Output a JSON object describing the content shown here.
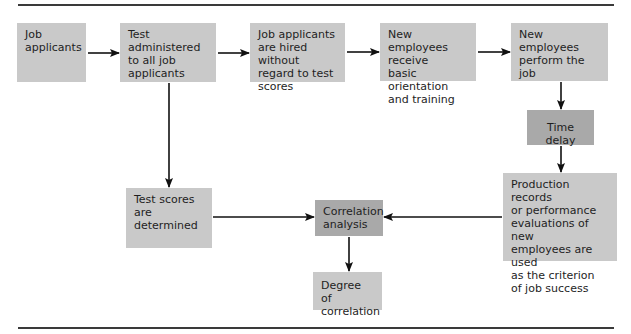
{
  "diagram": {
    "title": "",
    "nodes": [
      {
        "id": "job-applicants",
        "label": "Job\napplicants"
      },
      {
        "id": "test-administered",
        "label": "Test administered\nto all job\napplicants"
      },
      {
        "id": "hired-without-regard",
        "label": "Job applicants\nare hired without\nregard to test\nscores"
      },
      {
        "id": "orientation",
        "label": "New employees\nreceive\nbasic orientation\nand training"
      },
      {
        "id": "perform-job",
        "label": "New employees\nperform the\njob"
      },
      {
        "id": "time-delay",
        "label": "Time delay"
      },
      {
        "id": "production-records",
        "label": "Production records\nor performance\nevaluations of new\nemployees are used\nas the criterion\nof job success"
      },
      {
        "id": "test-scores",
        "label": "Test scores are\ndetermined"
      },
      {
        "id": "correlation-analysis",
        "label": "Correlation\nanalysis"
      },
      {
        "id": "degree-of-correlation",
        "label": "Degree of\ncorrelation"
      }
    ],
    "edges": [
      {
        "from": "job-applicants",
        "to": "test-administered"
      },
      {
        "from": "test-administered",
        "to": "hired-without-regard"
      },
      {
        "from": "hired-without-regard",
        "to": "orientation"
      },
      {
        "from": "orientation",
        "to": "perform-job"
      },
      {
        "from": "perform-job",
        "to": "time-delay"
      },
      {
        "from": "time-delay",
        "to": "production-records"
      },
      {
        "from": "test-administered",
        "to": "test-scores"
      },
      {
        "from": "test-scores",
        "to": "correlation-analysis"
      },
      {
        "from": "production-records",
        "to": "correlation-analysis"
      },
      {
        "from": "correlation-analysis",
        "to": "degree-of-correlation"
      }
    ],
    "colors": {
      "box": "#c9c9c9",
      "box_dark": "#a9a9a9",
      "arrow": "#111111",
      "rule": "#3a3a3a"
    }
  }
}
